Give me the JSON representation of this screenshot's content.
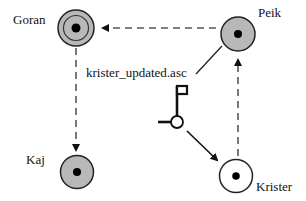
{
  "nodes": [
    {
      "id": "goran",
      "label": "Goran",
      "style": "double-ring-gray"
    },
    {
      "id": "peik",
      "label": "Peik",
      "style": "gray"
    },
    {
      "id": "kaj",
      "label": "Kaj",
      "style": "gray"
    },
    {
      "id": "krister",
      "label": "Krister",
      "style": "white"
    }
  ],
  "edges": [
    {
      "from": "peik",
      "to": "goran",
      "style": "dashed"
    },
    {
      "from": "goran",
      "to": "kaj",
      "style": "dashed"
    },
    {
      "from": "krister",
      "to": "peik",
      "style": "dashed"
    },
    {
      "from": "token",
      "to": "krister",
      "style": "solid"
    }
  ],
  "file_label": "krister_updated.asc",
  "token_icon": "flag-token-icon",
  "colors": {
    "node_fill_gray": "#b8b8b8",
    "node_fill_white": "#ffffff",
    "stroke": "#222222",
    "dashed": "#555555"
  }
}
